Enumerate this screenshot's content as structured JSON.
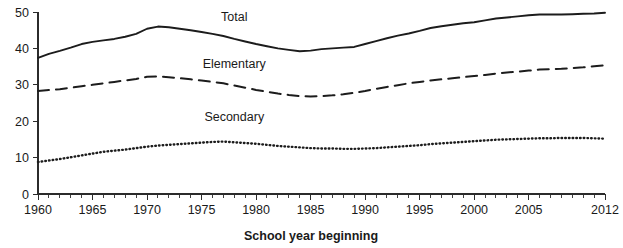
{
  "chart_data": {
    "type": "line",
    "title": "",
    "subtitle": "",
    "xlabel": "School year beginning",
    "ylabel": "",
    "xlim": [
      1960,
      2012
    ],
    "ylim": [
      0,
      50
    ],
    "grid": false,
    "legend_position": "inline-annotations",
    "x_ticks_major": [
      1960,
      1965,
      1970,
      1975,
      1980,
      1985,
      1990,
      1995,
      2000,
      2005,
      2012
    ],
    "x_tick_labels": [
      "1960",
      "1965",
      "1970",
      "1975",
      "1980",
      "1985",
      "1990",
      "1995",
      "2000",
      "2005",
      "2012"
    ],
    "x_tick_minor_step": 1,
    "y_ticks": [
      0,
      10,
      20,
      30,
      40,
      50
    ],
    "y_tick_labels": [
      "0",
      "10",
      "20",
      "30",
      "40",
      "50"
    ],
    "x": [
      1960,
      1961,
      1962,
      1963,
      1964,
      1965,
      1966,
      1967,
      1968,
      1969,
      1970,
      1971,
      1972,
      1973,
      1974,
      1975,
      1976,
      1977,
      1978,
      1979,
      1980,
      1981,
      1982,
      1983,
      1984,
      1985,
      1986,
      1987,
      1988,
      1989,
      1990,
      1991,
      1992,
      1993,
      1994,
      1995,
      1996,
      1997,
      1998,
      1999,
      2000,
      2001,
      2002,
      2003,
      2004,
      2005,
      2006,
      2007,
      2008,
      2009,
      2010,
      2011,
      2012
    ],
    "series": [
      {
        "name": "Total",
        "line_style": "solid",
        "label_x": 1978,
        "label_y": 47.5,
        "values": [
          37.4,
          38.5,
          39.3,
          40.2,
          41.2,
          41.8,
          42.2,
          42.6,
          43.2,
          44.0,
          45.4,
          46.0,
          45.8,
          45.4,
          45.0,
          44.5,
          44.0,
          43.4,
          42.6,
          41.9,
          41.2,
          40.6,
          40.0,
          39.6,
          39.2,
          39.4,
          39.8,
          40.0,
          40.2,
          40.4,
          41.2,
          42.0,
          42.8,
          43.5,
          44.1,
          44.8,
          45.6,
          46.1,
          46.5,
          46.9,
          47.2,
          47.7,
          48.2,
          48.5,
          48.8,
          49.1,
          49.3,
          49.3,
          49.3,
          49.4,
          49.5,
          49.6,
          49.8
        ]
      },
      {
        "name": "Elementary",
        "line_style": "dashed",
        "label_x": 1978,
        "label_y": 34.5,
        "values": [
          28.3,
          28.6,
          28.8,
          29.2,
          29.6,
          30.0,
          30.4,
          30.8,
          31.2,
          31.6,
          32.2,
          32.3,
          32.1,
          31.8,
          31.5,
          31.2,
          30.8,
          30.4,
          29.8,
          29.2,
          28.6,
          28.1,
          27.6,
          27.2,
          26.9,
          26.8,
          26.9,
          27.1,
          27.4,
          27.8,
          28.3,
          28.9,
          29.4,
          29.9,
          30.4,
          30.8,
          31.2,
          31.5,
          31.8,
          32.1,
          32.4,
          32.7,
          33.1,
          33.4,
          33.6,
          33.9,
          34.2,
          34.3,
          34.4,
          34.6,
          34.8,
          35.1,
          35.4
        ]
      },
      {
        "name": "Secondary",
        "line_style": "dotted",
        "label_x": 1978,
        "label_y": 20.0,
        "values": [
          8.8,
          9.2,
          9.6,
          10.1,
          10.6,
          11.1,
          11.6,
          11.9,
          12.2,
          12.6,
          13.0,
          13.3,
          13.5,
          13.7,
          13.9,
          14.1,
          14.3,
          14.4,
          14.2,
          14.0,
          13.8,
          13.5,
          13.2,
          13.0,
          12.8,
          12.6,
          12.5,
          12.5,
          12.4,
          12.4,
          12.5,
          12.6,
          12.8,
          13.0,
          13.2,
          13.4,
          13.7,
          13.9,
          14.1,
          14.3,
          14.5,
          14.7,
          14.9,
          15.0,
          15.1,
          15.2,
          15.3,
          15.3,
          15.4,
          15.4,
          15.4,
          15.3,
          15.2
        ]
      }
    ]
  }
}
